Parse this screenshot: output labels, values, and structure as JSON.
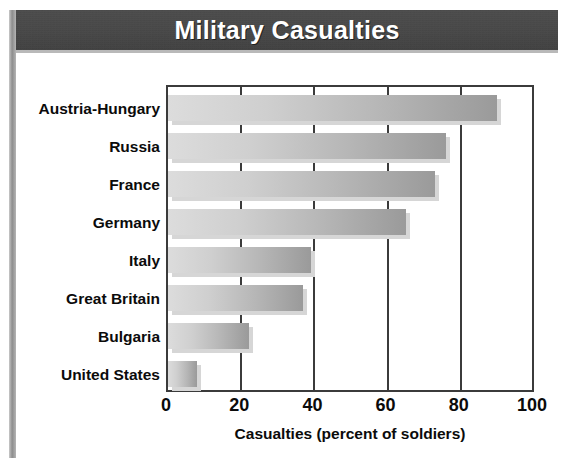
{
  "header": {
    "title": "Military Casualties"
  },
  "chart_data": {
    "type": "bar",
    "orientation": "horizontal",
    "title": "Military Casualties",
    "xlabel": "Casualties (percent of soldiers)",
    "ylabel": "",
    "xlim": [
      0,
      100
    ],
    "xticks": [
      "0",
      "20",
      "40",
      "60",
      "80",
      "100"
    ],
    "xtick_values": [
      0,
      20,
      40,
      60,
      80,
      100
    ],
    "grid": true,
    "legend": "none",
    "categories": [
      "Austria-Hungary",
      "Russia",
      "France",
      "Germany",
      "Italy",
      "Great Britain",
      "Bulgaria",
      "United States"
    ],
    "values": [
      90,
      76,
      73,
      65,
      39,
      37,
      22,
      8
    ],
    "bar_color_light": "#dcdcdc",
    "bar_color_dark": "#9a9a9a",
    "frame_color": "#3b3b3b",
    "title_band_color": "#464646",
    "title_text_color": "#ffffff"
  }
}
